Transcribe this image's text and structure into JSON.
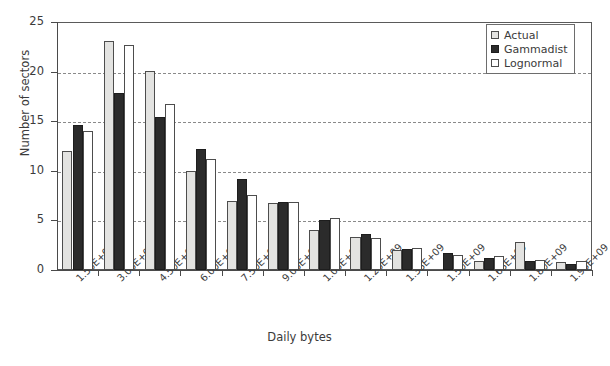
{
  "chart_data": {
    "type": "bar",
    "title": "",
    "xlabel": "Daily bytes",
    "ylabel": "Number of sectors",
    "ylim": [
      0,
      25
    ],
    "yticks": [
      0,
      5,
      10,
      15,
      20,
      25
    ],
    "grid": true,
    "legend_position": "top-right",
    "categories": [
      "1.50E+08",
      "3.00E+08",
      "4.50E+08",
      "6.00E+08",
      "7.50E+08",
      "9.00E+08",
      "1.05E+09",
      "1.20E+09",
      "1.35E+09",
      "1.50E+09",
      "1.65E+09",
      "1.80E+09",
      "1.95E+09"
    ],
    "series": [
      {
        "name": "Actual",
        "color": "#e3e3e1",
        "values": [
          12.0,
          23.1,
          20.1,
          10.0,
          7.0,
          6.8,
          4.0,
          3.3,
          2.0,
          0.0,
          0.9,
          2.8,
          0.8
        ]
      },
      {
        "name": "Gammadist",
        "color": "#2b2b2b",
        "values": [
          14.6,
          17.8,
          15.4,
          12.2,
          9.2,
          6.9,
          5.0,
          3.6,
          2.1,
          1.7,
          1.2,
          0.9,
          0.6
        ]
      },
      {
        "name": "Lognormal",
        "color": "#ffffff",
        "values": [
          14.0,
          22.7,
          16.7,
          11.2,
          7.6,
          6.9,
          5.2,
          3.2,
          2.2,
          1.5,
          1.4,
          1.0,
          0.9
        ]
      }
    ]
  },
  "legend": {
    "items": [
      {
        "label": "Actual",
        "swatch": "actual"
      },
      {
        "label": "Gammadist",
        "swatch": "gamma"
      },
      {
        "label": "Lognormal",
        "swatch": "lognormal"
      }
    ]
  },
  "axes": {
    "y_title": "Number of sectors",
    "x_title": "Daily bytes",
    "y_tick_labels": [
      "0",
      "5",
      "10",
      "15",
      "20",
      "25"
    ]
  },
  "caption": {
    "text": ""
  }
}
